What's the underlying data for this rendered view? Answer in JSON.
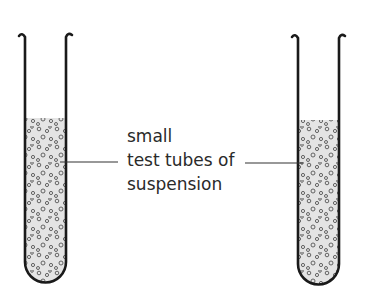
{
  "diagram": {
    "label_lines": [
      "small",
      "test tubes of",
      "suspension"
    ],
    "tubes": [
      {
        "name": "left-test-tube",
        "contents": "suspension"
      },
      {
        "name": "right-test-tube",
        "contents": "suspension"
      }
    ],
    "colors": {
      "outline": "#1a1a1a",
      "liquid": "#e4e4e4",
      "particle": "#555555"
    }
  }
}
